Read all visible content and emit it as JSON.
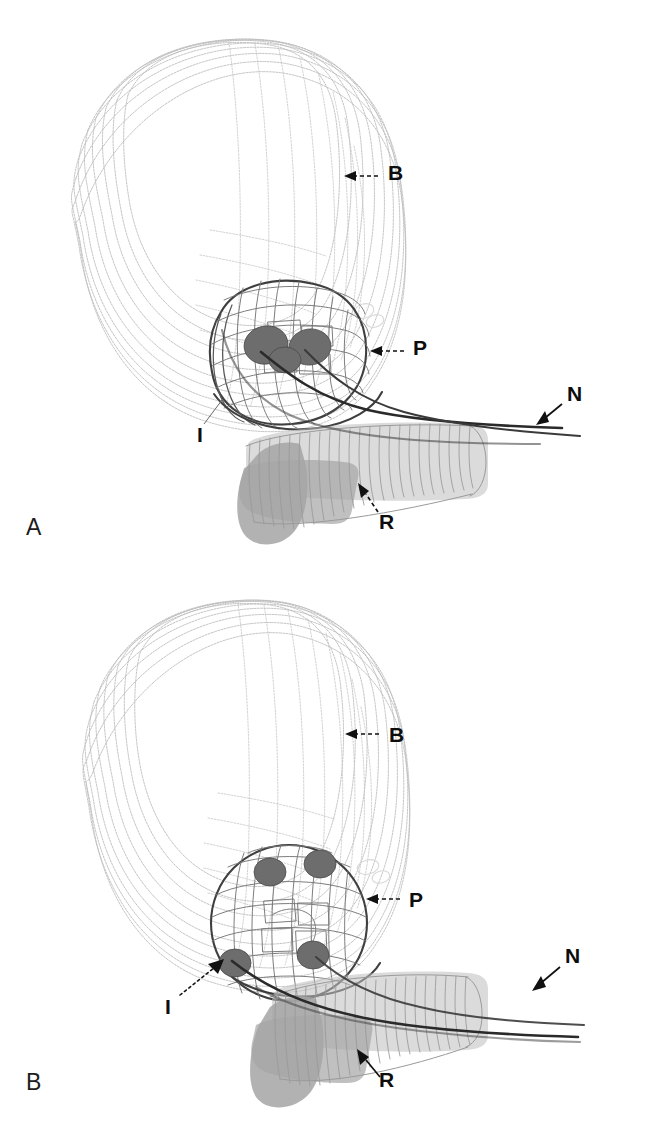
{
  "figure": {
    "type": "3d-wireframe-anatomical-reconstruction",
    "background_color": "#ffffff",
    "width": 646,
    "height": 1129,
    "panel_count": 2
  },
  "legend_keys": [
    {
      "key": "B",
      "meaning": "bladder"
    },
    {
      "key": "P",
      "meaning": "prostate"
    },
    {
      "key": "R",
      "meaning": "rectum"
    },
    {
      "key": "N",
      "meaning": "neurovascular bundle"
    },
    {
      "key": "I",
      "meaning": "implant"
    }
  ],
  "colors": {
    "bladder": "#b9b9b9",
    "prostate": "#585858",
    "prostate_rim": "#3f3f3f",
    "rectum": "#a5a5a5",
    "nerve": "#2a2a2a",
    "nodule": "#6d6d6d",
    "label_text": "#0d0d0d",
    "background": "#ffffff"
  },
  "panels": [
    {
      "id": "panel-a",
      "letter": "A",
      "letter_position": {
        "x": 26,
        "y": 516
      },
      "annotations": [
        {
          "key": "B",
          "label": "B",
          "x": 388,
          "y": 172,
          "leader": "dashed",
          "arrow_direction": "left"
        },
        {
          "key": "P",
          "label": "P",
          "x": 413,
          "y": 347,
          "leader": "dashed",
          "arrow_direction": "left"
        },
        {
          "key": "N",
          "label": "N",
          "x": 567,
          "y": 393,
          "leader": "solid",
          "arrow_direction": "down-left"
        },
        {
          "key": "I",
          "label": "I",
          "x": 197,
          "y": 434,
          "leader": "thin",
          "arrow_direction": "up-right"
        },
        {
          "key": "R",
          "label": "R",
          "x": 379,
          "y": 521,
          "leader": "dashed",
          "arrow_direction": "up-left"
        }
      ],
      "nodule_count": 2
    },
    {
      "id": "panel-b",
      "letter": "B",
      "letter_position": {
        "x": 26,
        "y": 1071
      },
      "annotations": [
        {
          "key": "B",
          "label": "B",
          "x": 389,
          "y": 731,
          "leader": "dashed",
          "arrow_direction": "left"
        },
        {
          "key": "P",
          "label": "P",
          "x": 409,
          "y": 896,
          "leader": "dashed",
          "arrow_direction": "left"
        },
        {
          "key": "N",
          "label": "N",
          "x": 565,
          "y": 955,
          "leader": "solid",
          "arrow_direction": "down-left"
        },
        {
          "key": "I",
          "label": "I",
          "x": 165,
          "y": 1006,
          "leader": "dotted",
          "arrow_direction": "up-right"
        },
        {
          "key": "R",
          "label": "R",
          "x": 379,
          "y": 1079,
          "leader": "solid",
          "arrow_direction": "up-left"
        }
      ],
      "nodule_count": 4
    }
  ]
}
